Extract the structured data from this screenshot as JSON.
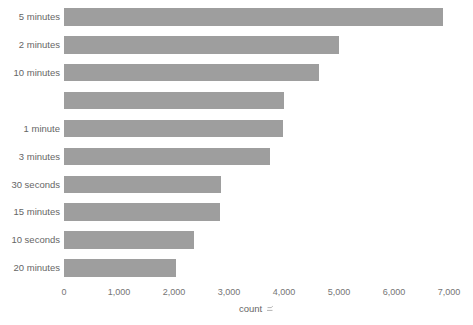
{
  "chart_data": {
    "type": "bar",
    "orientation": "horizontal",
    "title": "",
    "categories": [
      "5 minutes",
      "2 minutes",
      "10 minutes",
      "",
      "1 minute",
      "3 minutes",
      "30 seconds",
      "15 minutes",
      "10 seconds",
      "20 minutes"
    ],
    "values": [
      6890,
      5000,
      4640,
      4000,
      3980,
      3750,
      2855,
      2840,
      2355,
      2030
    ],
    "xlabel": "count",
    "xlabel_icon": "sort-icon",
    "xticks": [
      "0",
      "1,000",
      "2,000",
      "3,000",
      "4,000",
      "5,000",
      "6,000",
      "7,000"
    ],
    "xtick_values": [
      0,
      1000,
      2000,
      3000,
      4000,
      5000,
      6000,
      7000
    ],
    "xlim": [
      0,
      7000
    ],
    "grid": false,
    "legend": false,
    "colors": {
      "bar": "#9e9e9e",
      "category_label": "#666666",
      "tick_label": "#757575",
      "axis_label": "#666666",
      "sort_icon": "#b5b5b5",
      "background": "#ffffff"
    }
  }
}
